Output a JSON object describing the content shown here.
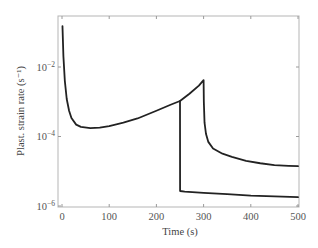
{
  "chart_data": {
    "type": "line",
    "title": "",
    "xlabel": "Time (s)",
    "ylabel": "Plast. strain rate (s⁻¹)",
    "xlim": [
      0,
      500
    ],
    "ylim": [
      1e-06,
      0.3
    ],
    "yscale": "log",
    "grid": false,
    "legend": null,
    "x_ticks": [
      0,
      100,
      200,
      300,
      400,
      500
    ],
    "x_tick_labels": [
      "0",
      "100",
      "200",
      "300",
      "400",
      "500"
    ],
    "y_ticks": [
      0.01,
      0.0001,
      1e-06
    ],
    "y_tick_labels": [
      {
        "base": "10",
        "exp": "−2"
      },
      {
        "base": "10",
        "exp": "−4"
      },
      {
        "base": "10",
        "exp": "−6"
      }
    ],
    "series": [
      {
        "name": "Loading (to 300 s) then relaxation",
        "x": [
          1,
          3,
          6,
          10,
          15,
          20,
          30,
          40,
          60,
          80,
          100,
          130,
          160,
          200,
          230,
          250,
          270,
          290,
          300,
          300.5,
          302,
          305,
          310,
          320,
          340,
          360,
          390,
          420,
          450,
          480,
          500
        ],
        "y": [
          0.15,
          0.02,
          0.004,
          0.0012,
          0.00055,
          0.00034,
          0.00022,
          0.00019,
          0.000175,
          0.00018,
          0.0002,
          0.00025,
          0.00033,
          0.00055,
          0.00082,
          0.00105,
          0.0017,
          0.0029,
          0.0042,
          0.001,
          0.00025,
          0.00012,
          7e-05,
          4.5e-05,
          3.2e-05,
          2.6e-05,
          2e-05,
          1.7e-05,
          1.5e-05,
          1.43e-05,
          1.4e-05
        ]
      },
      {
        "name": "Drop at 250 s then relaxation",
        "x": [
          250,
          250.2,
          260,
          300,
          350,
          400,
          450,
          500
        ],
        "y": [
          0.00105,
          2.7e-06,
          2.6e-06,
          2.4e-06,
          2.2e-06,
          2e-06,
          1.9e-06,
          1.8e-06
        ]
      }
    ]
  },
  "axes": {
    "xlabel": "Time (s)",
    "ylabel": "Plast. strain rate (s⁻¹)"
  }
}
